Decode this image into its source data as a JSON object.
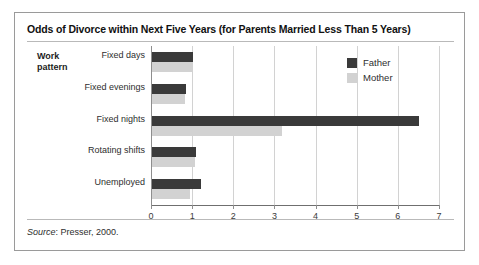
{
  "chart_data": {
    "type": "bar",
    "orientation": "horizontal",
    "title": "Odds of Divorce within Next Five Years (for Parents Married Less Than 5 Years)",
    "xlabel": "",
    "ylabel": "Work pattern",
    "categories": [
      "Fixed days",
      "Fixed evenings",
      "Fixed nights",
      "Rotating shifts",
      "Unemployed"
    ],
    "series": [
      {
        "name": "Father",
        "color": "#3a3a3a",
        "values": [
          1.0,
          0.82,
          6.5,
          1.08,
          1.2
        ]
      },
      {
        "name": "Mother",
        "color": "#d2d2d2",
        "values": [
          0.97,
          0.8,
          3.15,
          1.05,
          0.92
        ]
      }
    ],
    "xlim": [
      0,
      7
    ],
    "xticks": [
      0,
      1,
      2,
      3,
      4,
      5,
      6,
      7
    ],
    "xtick_labels": [
      "0",
      "1",
      "2",
      "3",
      "4",
      "5",
      "6",
      "7"
    ],
    "grid": true,
    "legend_position": "top-right"
  },
  "axis_title": "Work\npattern",
  "legend": {
    "items": [
      {
        "label": "Father"
      },
      {
        "label": "Mother"
      }
    ]
  },
  "footer": {
    "source_word": "Source",
    "source_text": ": Presser, 2000."
  }
}
